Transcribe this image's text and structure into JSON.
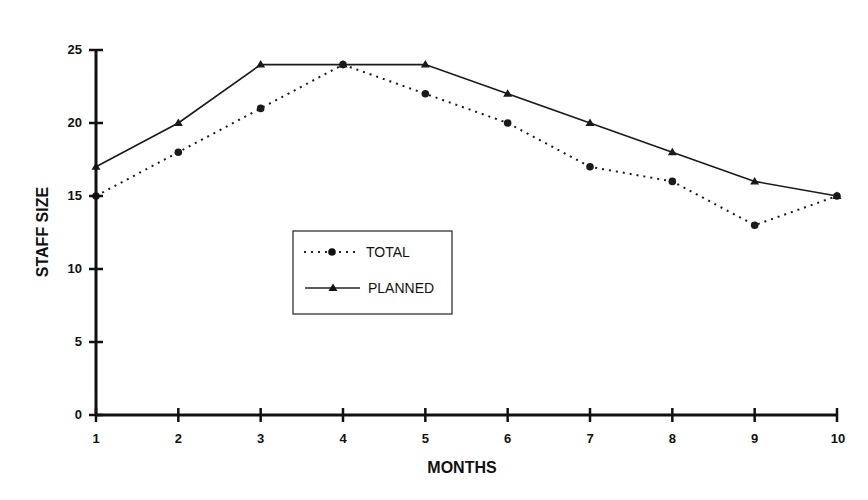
{
  "chart_data": {
    "type": "line",
    "title": "",
    "xlabel": "MONTHS",
    "ylabel": "STAFF SIZE",
    "x": [
      1,
      2,
      3,
      4,
      5,
      6,
      7,
      8,
      9,
      10
    ],
    "xlim": [
      1,
      10
    ],
    "ylim": [
      0,
      25
    ],
    "yticks": [
      0,
      5,
      10,
      15,
      20,
      25
    ],
    "xticks": [
      1,
      2,
      3,
      4,
      5,
      6,
      7,
      8,
      9,
      10
    ],
    "grid": false,
    "legend_position": "center-left inside plot",
    "series": [
      {
        "name": "TOTAL",
        "style": "dotted",
        "marker": "circle",
        "values": [
          15,
          18,
          21,
          24,
          22,
          20,
          17,
          16,
          13,
          15
        ]
      },
      {
        "name": "PLANNED",
        "style": "solid",
        "marker": "triangle",
        "values": [
          17,
          20,
          24,
          24,
          24,
          22,
          20,
          18,
          16,
          15
        ]
      }
    ]
  },
  "legend": {
    "items": [
      {
        "label": "TOTAL"
      },
      {
        "label": "PLANNED"
      }
    ]
  },
  "colors": {
    "line": "#1a1a1a",
    "axis": "#111111",
    "background": "#ffffff"
  }
}
